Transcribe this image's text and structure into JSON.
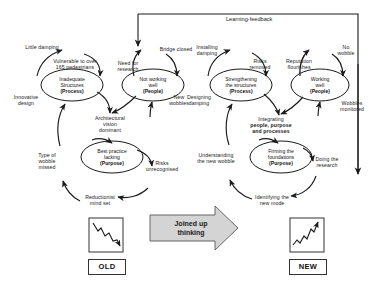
{
  "diagram": {
    "learning_feedback_label": "Learning-feedback",
    "center_arrow_label_line1": "Joined up",
    "center_arrow_label_line2": "thinking",
    "old_label": "OLD",
    "new_label": "NEW",
    "colors": {
      "line": "#1a1a1a",
      "text": "#1a1a1a",
      "arrow_fill": "#d4d4d4",
      "arrow_stroke": "#555555",
      "background": "#ffffff"
    }
  },
  "old_cluster": {
    "nodes": [
      {
        "id": "old-process",
        "line1": "Inadequate",
        "line2": "Structures",
        "line3": "(Process)"
      },
      {
        "id": "old-people",
        "line1": "Not working",
        "line2": "well",
        "line3": "(People)"
      },
      {
        "id": "old-purpose",
        "line1": "Best practice",
        "line2": "lacking",
        "line3": "(Purpose)"
      }
    ],
    "annotations": [
      {
        "id": "little-damping",
        "text": "Little damping"
      },
      {
        "id": "vulnerable",
        "text": "Vulnerable to over 165 pedestrians"
      },
      {
        "id": "need-research",
        "text": "Need for research"
      },
      {
        "id": "bridge-closed",
        "text": "Bridge closed"
      },
      {
        "id": "innovative-design",
        "text": "Innovative design"
      },
      {
        "id": "new-wobbles",
        "text": "New wobbles"
      },
      {
        "id": "architectural-vision",
        "text": "Architectural vision dominant"
      },
      {
        "id": "type-wobble-missed",
        "text": "Type of wobble missed"
      },
      {
        "id": "risks-unrecognised",
        "text": "Risks unrecognised"
      },
      {
        "id": "reductionist",
        "text": "Reductionist mind set"
      }
    ]
  },
  "new_cluster": {
    "nodes": [
      {
        "id": "new-process",
        "line1": "Strengthening",
        "line2": "the structures",
        "line3": "(Process)"
      },
      {
        "id": "new-people",
        "line1": "Working",
        "line2": "well",
        "line3": "(People)"
      },
      {
        "id": "new-purpose",
        "line1": "Firming the",
        "line2": "foundations",
        "line3": "(Purpose)"
      }
    ],
    "annotations": [
      {
        "id": "installing-damping",
        "text": "Installing damping"
      },
      {
        "id": "risks-removed",
        "text": "Risks removed"
      },
      {
        "id": "reputation-flourishes",
        "text": "Reputation flourishes"
      },
      {
        "id": "no-wobble",
        "text": "No wobble"
      },
      {
        "id": "designing-damping",
        "text": "Designing damping"
      },
      {
        "id": "wobbles-monitored",
        "text": "Wobbles monitored"
      },
      {
        "id": "integrating",
        "text": "Integrating people, purpose and processes"
      },
      {
        "id": "understanding-wobble",
        "text": "Understanding the new wobble"
      },
      {
        "id": "doing-research",
        "text": "Doing the research"
      },
      {
        "id": "identifying-mode",
        "text": "Identifying the new mode"
      }
    ]
  },
  "charts": {
    "old_trend": {
      "direction": "declining",
      "description": "downward zig-zag line with arrowhead"
    },
    "new_trend": {
      "direction": "rising",
      "description": "upward zig-zag line with arrowhead"
    }
  },
  "text": {
    "little_damping": "Little damping",
    "vulnerable_l1": "Vulnerable to over",
    "vulnerable_l2": "165 pedestrians",
    "need_for_l1": "Need for",
    "need_for_l2": "research",
    "bridge_closed": "Bridge closed",
    "innovative_l1": "Innovative",
    "innovative_l2": "design",
    "new_wobbles_l1": "New",
    "new_wobbles_l2": "wobbles",
    "arch_l1": "Architectural",
    "arch_l2": "vision",
    "arch_l3": "dominant",
    "type_l1": "Type of",
    "type_l2": "wobble",
    "type_l3": "missed",
    "risks_unrec_l1": "Risks",
    "risks_unrec_l2": "unrecognised",
    "reduct_l1": "Reductionist",
    "reduct_l2": "mind set",
    "installing_l1": "Installing",
    "installing_l2": "damping",
    "risks_rem_l1": "Risks",
    "risks_rem_l2": "removed",
    "reputation_l1": "Reputation",
    "reputation_l2": "flourishes",
    "no_wobble_l1": "No",
    "no_wobble_l2": "wobble",
    "designing_l1": "Designing",
    "designing_l2": "damping",
    "wobbles_mon_l1": "Wobbles",
    "wobbles_mon_l2": "monitored",
    "integrating_l1": "Integrating",
    "integrating_l2": "people, purpose",
    "integrating_l3": "and processes",
    "understanding_l1": "Understanding",
    "understanding_l2": "the new wobble",
    "doing_l1": "Doing the",
    "doing_l2": "research",
    "identifying_l1": "Identifying the",
    "identifying_l2": "new mode",
    "old_p1": "Inadequate",
    "old_p2": "Structures",
    "old_p3": "(Process)",
    "old_pe1": "Not working",
    "old_pe2": "well",
    "old_pe3": "(People)",
    "old_pu1": "Best practice",
    "old_pu2": "lacking",
    "old_pu3": "(Purpose)",
    "new_p1": "Strengthening",
    "new_p2": "the structures",
    "new_p3": "(Process)",
    "new_pe1": "Working",
    "new_pe2": "well",
    "new_pe3": "(People)",
    "new_pu1": "Firming the",
    "new_pu2": "foundations",
    "new_pu3": "(Purpose)"
  }
}
